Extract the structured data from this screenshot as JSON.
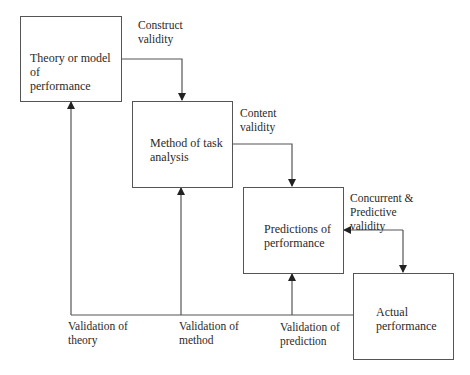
{
  "diagram": {
    "boxes": [
      {
        "id": "theory",
        "label": "Theory or model of\nperformance"
      },
      {
        "id": "method",
        "label": "Method of task\nanalysis"
      },
      {
        "id": "predictions",
        "label": "Predictions of\nperformance"
      },
      {
        "id": "actual",
        "label": "Actual\nperformance"
      }
    ],
    "edge_labels": {
      "construct": "Construct\nvalidity",
      "content": "Content\nvalidity",
      "concurrent": "Concurrent &\nPredictive\nvalidity",
      "val_theory": "Validation of\ntheory",
      "val_method": "Validation of\nmethod",
      "val_prediction": "Validation of\nprediction"
    },
    "colors": {
      "line": "#555555",
      "text": "#2a2a2a"
    }
  }
}
